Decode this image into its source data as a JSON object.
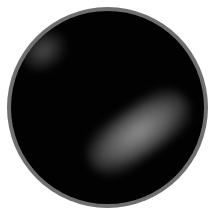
{
  "image": {
    "description": "Circular microscope field of view, dark background with a bright diffuse elongated blob and a faint blob at upper-left",
    "colors": {
      "frame": "#6f6f6f",
      "background": "#020202",
      "blob": "#aaaaaa",
      "page": "#ffffff"
    }
  }
}
